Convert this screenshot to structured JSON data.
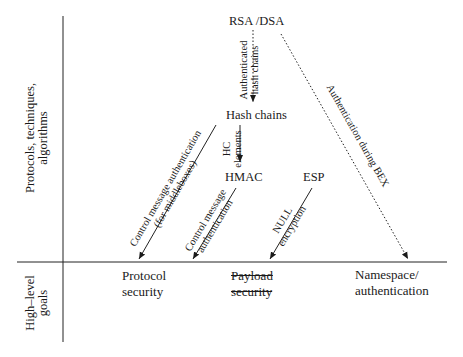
{
  "diagram": {
    "axes": {
      "vertical_upper_label": [
        "Protocols, techniques,",
        "algorithms"
      ],
      "vertical_lower_label": [
        "High–level",
        "goals"
      ]
    },
    "nodes": {
      "rsa_dsa": "RSA /DSA",
      "hash_chains": "Hash chains",
      "hmac": "HMAC",
      "esp": "ESP"
    },
    "goals": {
      "protocol_security": [
        "Protocol",
        "security"
      ],
      "payload_security": [
        "Payload",
        "security"
      ],
      "namespace_authentication": [
        "Namespace/",
        "authentication"
      ]
    },
    "edges": [
      {
        "from": "RSA /DSA",
        "to": "Hash chains",
        "label": [
          "Authenticated",
          "hash chains"
        ],
        "style": "dotted"
      },
      {
        "from": "RSA /DSA",
        "to": "Namespace/authentication",
        "label": [
          "Authentication during BEX"
        ],
        "style": "dotted"
      },
      {
        "from": "Hash chains",
        "to": "HMAC",
        "label": [
          "HC",
          "elements"
        ],
        "style": "solid"
      },
      {
        "from": "Hash chains",
        "to": "Protocol security",
        "label": [
          "Control message authentication",
          "(for middleboxes)"
        ],
        "style": "solid"
      },
      {
        "from": "HMAC",
        "to": "Protocol security",
        "label": [
          "Control message",
          "authentication"
        ],
        "style": "solid"
      },
      {
        "from": "ESP",
        "to": "Payload security",
        "label": [
          "NULL",
          "encryption"
        ],
        "style": "solid"
      }
    ]
  }
}
